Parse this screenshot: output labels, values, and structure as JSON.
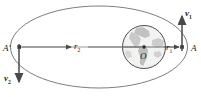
{
  "figure": {
    "type": "orbital-diagram",
    "background_color": "#ffffff",
    "stroke_color": "#555555",
    "axis_color": "#707070",
    "earth_land_color": "#b9b9b9",
    "earth_ocean_color": "#efefef",
    "vector_color": "#4a4a4a"
  },
  "geometry": {
    "ellipse": {
      "cx": 99,
      "cy": 47,
      "rx": 89,
      "ry": 41
    },
    "earth": {
      "cx": 144,
      "cy": 47,
      "r": 22
    },
    "focus_dot": {
      "cx": 144,
      "cy": 47,
      "r": 1.6
    },
    "axis": {
      "x1": 19,
      "y1": 47,
      "x2": 188,
      "y2": 47
    },
    "apoapsis_point": {
      "x": 19,
      "y": 47
    },
    "periapsis_point": {
      "x": 182,
      "y": 47
    },
    "v1_vector": {
      "x": 182,
      "y_tail": 50,
      "y_head": 13
    },
    "v2_vector": {
      "x": 19,
      "y_tail": 45,
      "y_head": 85
    }
  },
  "labels": {
    "apoapsis": "A'",
    "periapsis": "A",
    "radius_near": "r",
    "radius_near_sub": "1",
    "radius_far": "r",
    "radius_far_sub": "2",
    "center": "O",
    "velocity_near": "v",
    "velocity_near_sub": "1",
    "velocity_far": "v",
    "velocity_far_sub": "2"
  }
}
